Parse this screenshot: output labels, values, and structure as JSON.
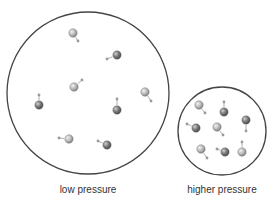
{
  "diagram": {
    "colors": {
      "outline": "#444444",
      "particle_light": "#b8b8b8",
      "particle_dark": "#7a7a7a",
      "arrow": "#9a9a9a"
    },
    "containers": [
      {
        "id": "low",
        "label": "low pressure",
        "cx": 88,
        "cy": 93,
        "r": 81,
        "particles": [
          {
            "x": 73,
            "y": 33,
            "shade": "light",
            "ax": 78,
            "ay": 41
          },
          {
            "x": 117,
            "y": 55,
            "shade": "dark",
            "ax": 107,
            "ay": 59
          },
          {
            "x": 74,
            "y": 87,
            "shade": "light",
            "ax": 82,
            "ay": 80
          },
          {
            "x": 39,
            "y": 105,
            "shade": "dark",
            "ax": 39,
            "ay": 95
          },
          {
            "x": 145,
            "y": 92,
            "shade": "light",
            "ax": 151,
            "ay": 101
          },
          {
            "x": 117,
            "y": 110,
            "shade": "dark",
            "ax": 117,
            "ay": 99
          },
          {
            "x": 69,
            "y": 139,
            "shade": "light",
            "ax": 59,
            "ay": 138
          },
          {
            "x": 107,
            "y": 145,
            "shade": "dark",
            "ax": 98,
            "ay": 141
          }
        ]
      },
      {
        "id": "high",
        "label": "higher pressure",
        "cx": 222,
        "cy": 131,
        "r": 44,
        "particles": [
          {
            "x": 199,
            "y": 105,
            "shade": "light",
            "ax": 205,
            "ay": 113
          },
          {
            "x": 224,
            "y": 112,
            "shade": "dark",
            "ax": 224,
            "ay": 102
          },
          {
            "x": 196,
            "y": 128,
            "shade": "dark",
            "ax": 187,
            "ay": 124
          },
          {
            "x": 217,
            "y": 127,
            "shade": "light",
            "ax": 223,
            "ay": 135
          },
          {
            "x": 246,
            "y": 120,
            "shade": "dark",
            "ax": 246,
            "ay": 131
          },
          {
            "x": 201,
            "y": 149,
            "shade": "light",
            "ax": 207,
            "ay": 158
          },
          {
            "x": 225,
            "y": 152,
            "shade": "dark",
            "ax": 217,
            "ay": 149
          },
          {
            "x": 242,
            "y": 152,
            "shade": "light",
            "ax": 242,
            "ay": 142
          }
        ]
      }
    ]
  }
}
